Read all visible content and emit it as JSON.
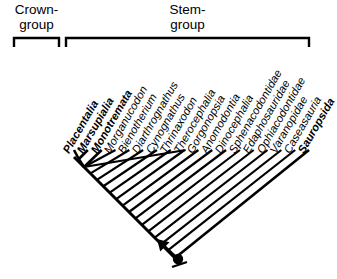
{
  "figure": {
    "type": "cladogram",
    "brackets": [
      {
        "id": "crown-group",
        "label": "Crown-\ngroup",
        "line1": "Crown-",
        "line2": "group",
        "x_start": 14,
        "x_end": 59
      },
      {
        "id": "stem-group",
        "label": "Stem-\ngroup",
        "line1": "Stem-",
        "line2": "group",
        "x_start": 66,
        "x_end": 309
      }
    ],
    "taxa": [
      {
        "name": "Placentalia",
        "bold": true,
        "group": "crown"
      },
      {
        "name": "Marsupialia",
        "bold": true,
        "group": "crown"
      },
      {
        "name": "Monotremata",
        "bold": true,
        "group": "crown"
      },
      {
        "name": "Morganucodon",
        "bold": false,
        "group": "stem"
      },
      {
        "name": "Bienotherium",
        "bold": false,
        "group": "stem"
      },
      {
        "name": "Diarthrognathus",
        "bold": false,
        "group": "stem"
      },
      {
        "name": "Cynognathus",
        "bold": false,
        "group": "stem"
      },
      {
        "name": "Thrinaxodon",
        "bold": false,
        "group": "stem"
      },
      {
        "name": "Therocephalia",
        "bold": false,
        "group": "stem"
      },
      {
        "name": "Gorgonopsia",
        "bold": false,
        "group": "stem"
      },
      {
        "name": "Anomodontia",
        "bold": false,
        "group": "stem"
      },
      {
        "name": "Dinocephalia",
        "bold": false,
        "group": "stem"
      },
      {
        "name": "Sphenacodontidae",
        "bold": false,
        "group": "stem"
      },
      {
        "name": "Edaphosauridae",
        "bold": false,
        "group": "stem"
      },
      {
        "name": "Ophiacodontidae",
        "bold": false,
        "group": "stem"
      },
      {
        "name": "Varanopidae",
        "bold": false,
        "group": "stem"
      },
      {
        "name": "Caseasauria",
        "bold": false,
        "group": "stem"
      },
      {
        "name": "Sauropsida",
        "bold": true,
        "group": "outgroup"
      }
    ],
    "markers": {
      "root_node": "filled-circle",
      "root_arrow": "arrow-pointing-up-left"
    },
    "colors": {
      "ink": "#000000",
      "background": "#ffffff"
    }
  }
}
